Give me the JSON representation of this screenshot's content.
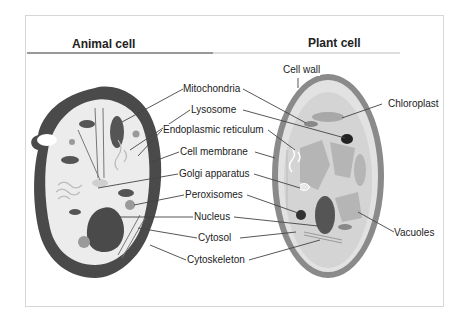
{
  "titles": {
    "animal": "Animal cell",
    "plant": "Plant cell"
  },
  "labels": {
    "mitochondria": "Mitochondria",
    "lysosome": "Lysosome",
    "endoplasmic_reticulum": "Endoplasmic reticulum",
    "cell_membrane": "Cell membrane",
    "golgi_apparatus": "Golgi apparatus",
    "peroxisomes": "Peroxisomes",
    "nucleus": "Nucleus",
    "cytosol": "Cytosol",
    "cytoskeleton": "Cytoskeleton",
    "cell_wall": "Cell wall",
    "chloroplast": "Chloroplast",
    "vacuoles": "Vacuoles"
  },
  "colors": {
    "membrane_dark": "#4a4a4a",
    "cytoplasm": "#ececec",
    "organelle_dark": "#555555",
    "organelle_mid": "#9a9a9a",
    "plant_wall": "#8a8a8a",
    "plant_inner": "#d4d4d4",
    "vacuole": "#b5b5b5",
    "leader_line": "#444444"
  }
}
